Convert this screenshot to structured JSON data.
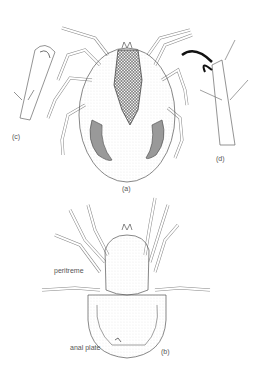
{
  "figure": {
    "panels": {
      "a": {
        "label": "(a)",
        "description": "dorsal view of mite"
      },
      "b": {
        "label": "(b)",
        "description": "ventral view of mite"
      },
      "c": {
        "label": "(c)",
        "description": "chelicera detail"
      },
      "d": {
        "label": "(d)",
        "description": "tarsus with claw detail"
      }
    },
    "annotations": {
      "peritreme": "peritreme",
      "anal_plate": "anal plate"
    },
    "colors": {
      "line": "#555555",
      "shading": "#888888",
      "dark": "#111111"
    }
  }
}
